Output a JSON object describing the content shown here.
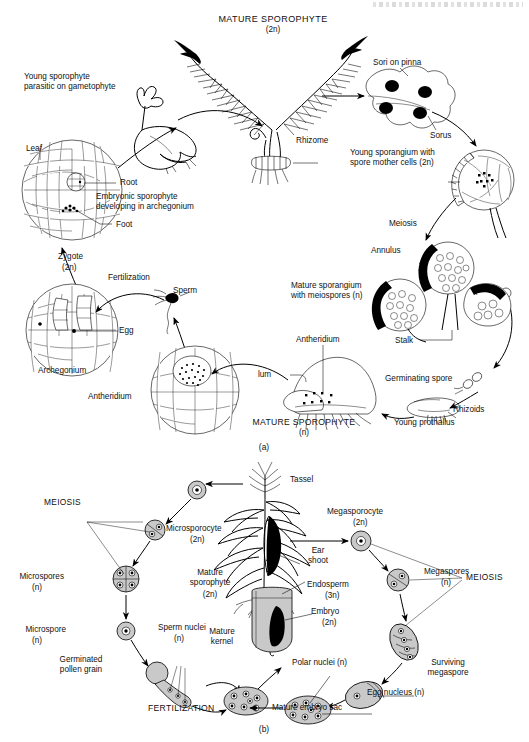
{
  "page": {
    "header_strip": "",
    "figure_a_caption": "(a)",
    "figure_b_caption": "(b)"
  },
  "figure_a": {
    "title": "Fern life cycle",
    "labels": {
      "mature_sporophyte": "MATURE SPOROPHYTE",
      "mature_sporophyte_ploidy": "(2n)",
      "rhizome": "Rhizome",
      "young_sporophyte": "Young sporophyte\nparasitic on gametophyte",
      "leaf": "Leaf",
      "root": "Root",
      "embryonic_sporophyte": "Embryonic sporophyte\ndeveloping in archegonium",
      "foot": "Foot",
      "sori_on_pinna": "Sori on pinna",
      "sorus": "Sorus",
      "young_sporangium": "Young sporangium with\nspore mother cells (2n)",
      "meiosis": "Meiosis",
      "annulus": "Annulus",
      "mature_sporangium": "Mature sporangium\nwith meiospores (n)",
      "stalk": "Stalk",
      "germinating_spore": "Germinating spore",
      "rhizoids": "Rhizoids",
      "young_prothallus": "Young prothallus",
      "mature_gametophyte": "MATURE SPOROPHYTE",
      "mature_gametophyte_ploidy": "(n)",
      "antheridium_top": "Antheridium",
      "lum": "lum",
      "antheridium_detail": "Antheridium",
      "sperm": "Sperm",
      "fertilization": "Fertilization",
      "zygote": "Zygote",
      "zygote_ploidy": "(2n)",
      "egg": "Egg",
      "archegonium": "Archegonium"
    }
  },
  "figure_b": {
    "title": "Corn (maize) life cycle",
    "labels": {
      "tassel": "Tassel",
      "meiosis_left": "MEIOSIS",
      "meiosis_right": "MEIOSIS",
      "microsporocyte": "Microsporocyte",
      "microsporocyte_ploidy": "(2n)",
      "microspores": "Microspores",
      "microspores_ploidy": "(n)",
      "microspore": "Microspore",
      "microspore_ploidy": "(n)",
      "sperm_nuclei": "Sperm nuclei",
      "sperm_nuclei_ploidy": "(n)",
      "germinated_pollen_grain": "Germinated\npollen grain",
      "fertilization": "FERTILIZATION",
      "mature_sporophyte": "Mature\nsporophyte",
      "mature_sporophyte_ploidy": "(2n)",
      "ear_shoot": "Ear\nshoot",
      "megasporocyte": "Megasporocyte",
      "megasporocyte_ploidy": "(2n)",
      "megaspores": "Megaspores",
      "megaspores_ploidy": "(n)",
      "surviving_megaspore": "Surviving\nmegaspore",
      "egg_nucleus": "Egg nucleus (n)",
      "polar_nuclei": "Polar nuclei (n)",
      "mature_embryo_sac": "Mature embryo sac",
      "mature_kernel": "Mature\nkernel",
      "endosperm": "Endosperm",
      "endosperm_ploidy": "(3n)",
      "embryo": "Embryo",
      "embryo_ploidy": "(2n)"
    }
  }
}
